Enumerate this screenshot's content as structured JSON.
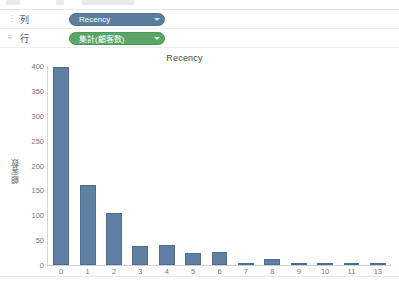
{
  "window": {
    "toolbar_clipped": true
  },
  "shelves": [
    {
      "grip_icon": "columns-grip-icon",
      "label": "列",
      "pill": {
        "text": "Recency",
        "color": "#5b7e9e",
        "kind": "dimension-blue"
      }
    },
    {
      "grip_icon": "rows-grip-icon",
      "label": "行",
      "pill": {
        "text": "集計(顧客数)",
        "color": "#5ba567",
        "kind": "measure-green"
      }
    }
  ],
  "chart_data": {
    "type": "bar",
    "title": "Recency",
    "xlabel": "",
    "ylabel": "顧客数",
    "categories": [
      "0",
      "1",
      "2",
      "3",
      "4",
      "5",
      "6",
      "7",
      "8",
      "9",
      "10",
      "11",
      "13"
    ],
    "values": [
      398,
      160,
      105,
      38,
      40,
      25,
      26,
      5,
      12,
      3,
      2,
      2,
      2
    ],
    "ylim": [
      0,
      400
    ],
    "yticks": [
      0,
      50,
      100,
      150,
      200,
      250,
      300,
      350,
      400
    ],
    "ytick_labels": [
      "0",
      "50",
      "100",
      "150",
      "200",
      "250",
      "300",
      "350",
      "400"
    ],
    "grid": false,
    "legend": "none",
    "bar_color": "#5f7fa3"
  }
}
